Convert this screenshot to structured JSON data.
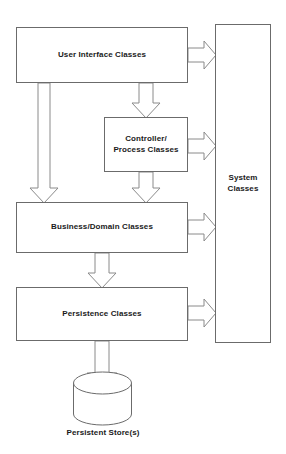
{
  "diagram": {
    "type": "layered-architecture",
    "background_color": "#ffffff",
    "box_stroke_color": "#6b6b6b",
    "arrow_stroke_color": "#8a8a8a",
    "text_color": "#1a1a1a",
    "nodes": [
      {
        "id": "user_interface",
        "label": "User Interface Classes",
        "shape": "rectangle",
        "x": 16,
        "y": 27,
        "width": 172,
        "height": 56
      },
      {
        "id": "controller_process",
        "label": "Controller/\nProcess Classes",
        "shape": "rectangle",
        "x": 104,
        "y": 117,
        "width": 84,
        "height": 55
      },
      {
        "id": "business_domain",
        "label": "Business/Domain Classes",
        "shape": "rectangle",
        "x": 16,
        "y": 202,
        "width": 172,
        "height": 51
      },
      {
        "id": "persistence",
        "label": "Persistence Classes",
        "shape": "rectangle",
        "x": 16,
        "y": 287,
        "width": 172,
        "height": 54
      },
      {
        "id": "system_classes",
        "label": "System\nClasses",
        "shape": "rectangle",
        "x": 215,
        "y": 24,
        "width": 56,
        "height": 319
      },
      {
        "id": "persistent_store",
        "label": "Persistent Store(s)",
        "shape": "cylinder",
        "x": 73,
        "y": 375,
        "width": 59,
        "height": 50
      }
    ],
    "edges": [
      {
        "id": "ui-to-system",
        "from": "user_interface",
        "to": "system_classes",
        "direction": "right",
        "style": "block-arrow"
      },
      {
        "id": "ui-to-controller",
        "from": "user_interface",
        "to": "controller_process",
        "direction": "down",
        "style": "block-arrow"
      },
      {
        "id": "ui-to-business",
        "from": "user_interface",
        "to": "business_domain",
        "direction": "down",
        "style": "block-arrow"
      },
      {
        "id": "controller-to-system",
        "from": "controller_process",
        "to": "system_classes",
        "direction": "right",
        "style": "block-arrow"
      },
      {
        "id": "controller-to-business",
        "from": "controller_process",
        "to": "business_domain",
        "direction": "down",
        "style": "block-arrow"
      },
      {
        "id": "business-to-system",
        "from": "business_domain",
        "to": "system_classes",
        "direction": "right",
        "style": "block-arrow"
      },
      {
        "id": "business-to-persistence",
        "from": "business_domain",
        "to": "persistence",
        "direction": "down",
        "style": "block-arrow"
      },
      {
        "id": "persistence-to-system",
        "from": "persistence",
        "to": "system_classes",
        "direction": "right",
        "style": "block-arrow"
      },
      {
        "id": "persistence-to-store",
        "from": "persistence",
        "to": "persistent_store",
        "direction": "down",
        "style": "block-arrow"
      }
    ]
  }
}
